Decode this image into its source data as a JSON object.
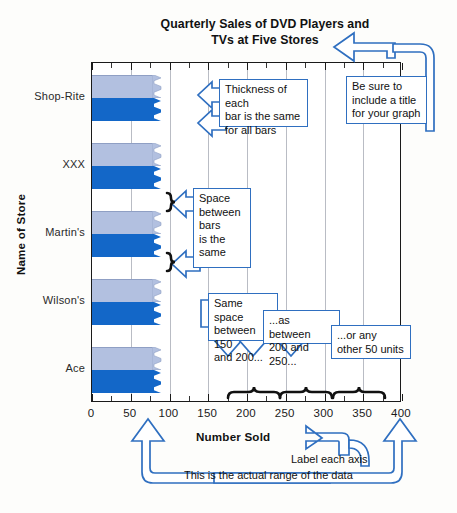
{
  "chart_data": {
    "type": "bar",
    "title": "Quarterly Sales of DVD Players and TVs at Five Stores",
    "title_line1": "Quarterly Sales of DVD Players and",
    "title_line2": "TVs at Five Stores",
    "xlabel": "Number Sold",
    "ylabel": "Name of Store",
    "categories": [
      "Shop-Rite",
      "XXX",
      "Martin's",
      "Wilson's",
      "Ace"
    ],
    "xticks": [
      0,
      50,
      100,
      150,
      200,
      250,
      300,
      350,
      400
    ],
    "xlim": [
      0,
      400
    ],
    "grid": "vertical",
    "legend": "none",
    "note": "All bars are drawn truncated with a jagged right edge at about 90 units",
    "series": [
      {
        "name": "DVD Players",
        "color": "#b2c0e0",
        "values": [
          90,
          90,
          90,
          90,
          90
        ]
      },
      {
        "name": "TVs",
        "color": "#1367c8",
        "values": [
          90,
          90,
          90,
          90,
          90
        ]
      }
    ]
  },
  "annotations": {
    "title_callout": {
      "text": "Be sure to include a title for your graph",
      "lines": [
        "Be sure to",
        "include a title",
        "for your graph"
      ]
    },
    "thickness_callout": {
      "text": "Thickness of each bar is the same for all bars",
      "lines": [
        "Thickness of each",
        "bar is the same",
        "for all bars"
      ]
    },
    "space_callout": {
      "text": "Space between bars is the same",
      "lines": [
        "Space",
        "between",
        "bars",
        "is the",
        "same"
      ]
    },
    "spacing150": {
      "text": "Same space between 150 and 200...",
      "lines": [
        "Same space",
        "between 150",
        "and 200..."
      ]
    },
    "spacing200": {
      "text": "...as between 200 and 250...",
      "lines": [
        "...as between",
        "200 and 250..."
      ]
    },
    "spacing300": {
      "text": "...or any other 50 units",
      "lines": [
        "...or any",
        "other 50 units"
      ]
    },
    "label_axis": {
      "text": "Label each axis"
    },
    "range_note": {
      "text": "This is the actual range of the data"
    }
  },
  "colors": {
    "accent": "#2f6fc0",
    "bar_light": "#b2c0e0",
    "bar_dark": "#1367c8",
    "grid": "#b9bcc4",
    "axis": "#1a1a1a",
    "page": "#fdfdfb"
  }
}
